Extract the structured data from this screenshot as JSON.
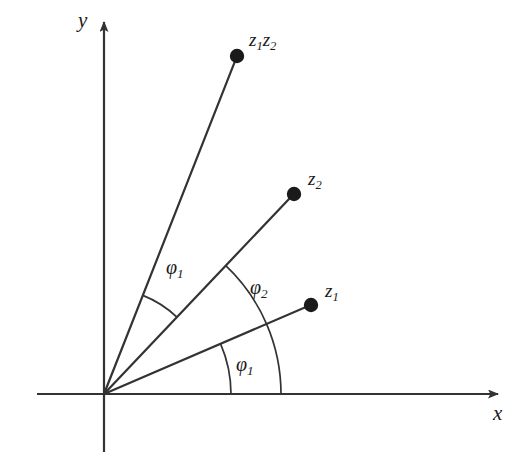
{
  "figure": {
    "background_color": "#ffffff",
    "stroke_color": "#333333",
    "text_color": "#1a1a1a",
    "origin": {
      "x": 104,
      "y": 394
    }
  },
  "axes": {
    "x": {
      "label": "x",
      "label_pos": {
        "x": 494,
        "y": 407
      },
      "start": {
        "x": 37,
        "y": 394
      },
      "end": {
        "x": 503,
        "y": 394
      },
      "arrow": true
    },
    "y": {
      "label": "y",
      "label_pos": {
        "x": 79,
        "y": 12
      },
      "start": {
        "x": 104,
        "y": 452
      },
      "end": {
        "x": 104,
        "y": 15
      },
      "arrow": true
    }
  },
  "points": [
    {
      "id": "z1z2",
      "label": "z",
      "sub1": "1",
      "label2": "z",
      "sub2": "2",
      "label_text": "z1z2",
      "dot": {
        "x": 237,
        "y": 56
      },
      "dot_radius": 7,
      "label_pos": {
        "x": 249,
        "y": 36
      },
      "angle_deg": 68.5,
      "radius_px": 362
    },
    {
      "id": "z2",
      "label": "z",
      "sub1": "2",
      "label_text": "z2",
      "dot": {
        "x": 294,
        "y": 194
      },
      "dot_radius": 7,
      "label_pos": {
        "x": 308,
        "y": 175
      },
      "angle_deg": 46.5,
      "radius_px": 276
    },
    {
      "id": "z1",
      "label": "z",
      "sub1": "1",
      "label_text": "z1",
      "dot": {
        "x": 311,
        "y": 305
      },
      "dot_radius": 7,
      "label_pos": {
        "x": 325,
        "y": 287
      },
      "angle_deg": 23.3,
      "radius_px": 225
    }
  ],
  "angle_arcs": [
    {
      "id": "phi1-lower",
      "symbol": "φ",
      "sub": "1",
      "label_text": "φ1",
      "from_deg": 0,
      "to_deg": 23.3,
      "radius_px": 127,
      "label_pos": {
        "x": 236,
        "y": 355
      },
      "description": "angle of z1 measured from positive x-axis"
    },
    {
      "id": "phi2",
      "symbol": "φ",
      "sub": "2",
      "label_text": "φ2",
      "from_deg": 0,
      "to_deg": 46.5,
      "radius_px": 177,
      "label_pos": {
        "x": 250,
        "y": 277
      },
      "description": "angle of z2 measured from positive x-axis; arc sweeps past z1 ray"
    },
    {
      "id": "phi1-upper",
      "symbol": "φ",
      "sub": "1",
      "label_text": "φ1",
      "from_deg": 46.5,
      "to_deg": 68.5,
      "radius_px": 106,
      "label_pos": {
        "x": 166,
        "y": 258
      },
      "description": "additional rotation by phi1 taking z2 ray to the z1*z2 ray"
    }
  ]
}
